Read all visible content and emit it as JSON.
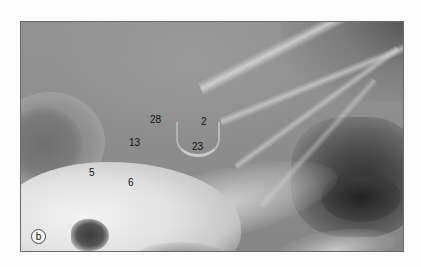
{
  "figure": {
    "panel_label": "b",
    "markers": [
      {
        "id": "28",
        "label": "28",
        "x": 129,
        "y": 93
      },
      {
        "id": "2",
        "label": "2",
        "x": 180,
        "y": 95
      },
      {
        "id": "13",
        "label": "13",
        "x": 108,
        "y": 116
      },
      {
        "id": "23",
        "label": "23",
        "x": 171,
        "y": 120
      },
      {
        "id": "5",
        "label": "5",
        "x": 68,
        "y": 146
      },
      {
        "id": "6",
        "label": "6",
        "x": 107,
        "y": 156
      }
    ]
  }
}
